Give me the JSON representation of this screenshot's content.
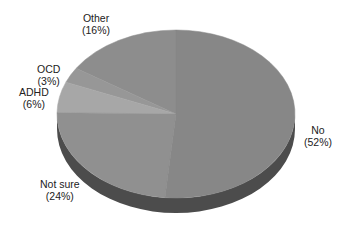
{
  "chart_data": {
    "type": "pie",
    "title": "",
    "style": "3d-pie",
    "start_angle_deg": 90,
    "direction": "counterclockwise-from-top-for-other",
    "categories": [
      "No",
      "Not sure",
      "ADHD",
      "OCD",
      "Other"
    ],
    "values": [
      52,
      24,
      6,
      3,
      16
    ],
    "unit": "%",
    "colors": {
      "No": "#878787",
      "Not sure": "#909090",
      "ADHD": "#a7a7a7",
      "OCD": "#979797",
      "Other": "#8d8d8d",
      "side": "#4c4c4c"
    },
    "labels": [
      {
        "name": "No",
        "pct": "(52%)"
      },
      {
        "name": "Not sure",
        "pct": "(24%)"
      },
      {
        "name": "ADHD",
        "pct": "(6%)"
      },
      {
        "name": "OCD",
        "pct": "(3%)"
      },
      {
        "name": "Other",
        "pct": "(16%)"
      }
    ],
    "legend": "none (inline labels)"
  }
}
